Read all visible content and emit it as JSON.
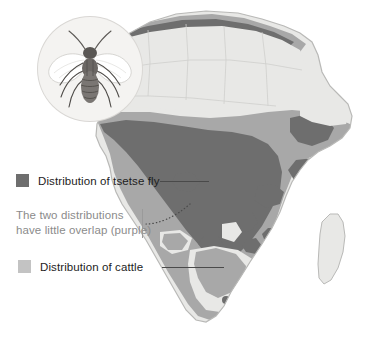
{
  "figure": {
    "base_map": "africa-continent"
  },
  "inset": {
    "name": "tsetse-fly-illustration",
    "caption": ""
  },
  "legend": {
    "tsetse": {
      "label": "Distribution of tsetse fly",
      "color": "#6e6e6e",
      "swatch_name": "tsetse-swatch"
    },
    "cattle": {
      "label": "Distribution of cattle",
      "color": "#c3c3c3",
      "swatch_name": "cattle-swatch"
    }
  },
  "annotation": {
    "line1": "The two distributions",
    "line2": "have little overlap (purple)",
    "color": "#8b8b8b"
  },
  "colors": {
    "tsetse_dark": "#6e6e6e",
    "cattle_mid": "#a8a8a8",
    "empty_light": "#e8e8e6",
    "sea": "#ffffff",
    "outline": "#b9b9b7",
    "leader": "#4a4a4a"
  }
}
